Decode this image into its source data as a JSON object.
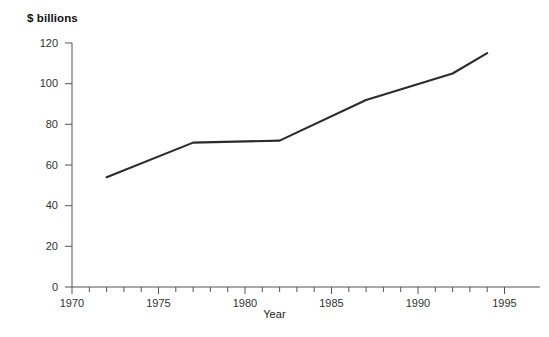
{
  "chart_data": {
    "type": "line",
    "title": "",
    "subtitle": "",
    "xlabel": "Year",
    "ylabel": "$ billions",
    "xlim": [
      1970,
      1995
    ],
    "ylim": [
      0,
      120
    ],
    "grid": false,
    "legend": null,
    "x_major_ticks": [
      1970,
      1975,
      1980,
      1985,
      1990,
      1995
    ],
    "x_minor_tick_interval": 1,
    "y_ticks": [
      0,
      20,
      40,
      60,
      80,
      100,
      120
    ],
    "line_color": "#2b2b2b",
    "line_width": 2,
    "x": [
      1972,
      1977,
      1982,
      1987,
      1992,
      1994
    ],
    "values": [
      54,
      71,
      72,
      92,
      105,
      115
    ],
    "series": [
      {
        "name": "",
        "points": [
          {
            "x": 1972,
            "y": 54
          },
          {
            "x": 1977,
            "y": 71
          },
          {
            "x": 1982,
            "y": 72
          },
          {
            "x": 1987,
            "y": 92
          },
          {
            "x": 1992,
            "y": 105
          },
          {
            "x": 1994,
            "y": 115
          }
        ]
      }
    ]
  },
  "axes": {
    "y_title": "$ billions",
    "x_title": "Year",
    "y_tick_labels": [
      "0",
      "20",
      "40",
      "60",
      "80",
      "100",
      "120"
    ],
    "x_tick_labels": [
      "1970",
      "1975",
      "1980",
      "1985",
      "1990",
      "1995"
    ]
  },
  "colors": {
    "line": "#2b2b2b",
    "axis": "#555555",
    "text": "#1a1a1a",
    "background": "#ffffff"
  }
}
